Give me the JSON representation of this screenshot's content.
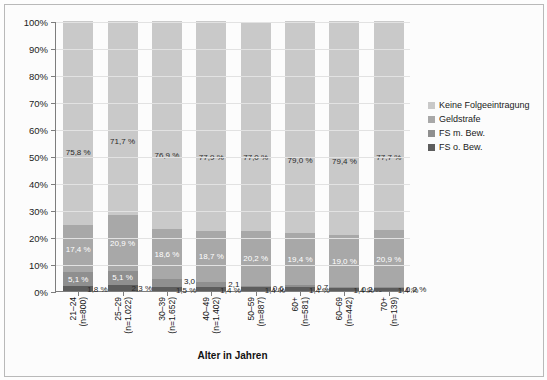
{
  "chart_data": {
    "type": "bar",
    "subtype": "stacked-100-percent",
    "title": "",
    "xlabel": "Alter in Jahren",
    "ylabel": "",
    "ylim": [
      0,
      100
    ],
    "ytick_labels": [
      "0%",
      "10%",
      "20%",
      "30%",
      "40%",
      "50%",
      "60%",
      "70%",
      "80%",
      "90%",
      "100%"
    ],
    "ytick_values": [
      0,
      10,
      20,
      30,
      40,
      50,
      60,
      70,
      80,
      90,
      100
    ],
    "grid": true,
    "legend_position": "right",
    "categories": [
      "21–24",
      "25–29",
      "30–39",
      "40–49",
      "50–59",
      "60+",
      "60–69",
      "70+"
    ],
    "category_sublabels": [
      "(n=800)",
      "(n=1.022)",
      "(n=1.652)",
      "(n=1.402)",
      "(n=887)",
      "(n=581)",
      "(n=442)",
      "(n=139)"
    ],
    "series": [
      {
        "name": "FS o. Bew.",
        "color": "#5d5d5d",
        "values": [
          1.8,
          2.3,
          1.5,
          1.4,
          1.4,
          1.4,
          1.4,
          1.4
        ],
        "labels": [
          "1,8 %",
          "2,3 %",
          "1,5 %",
          "1,4 %",
          "1,4 %",
          "1,4 %",
          "1,4 %",
          "1,4 %"
        ]
      },
      {
        "name": "FS m. Bew.",
        "color": "#8f8f8f",
        "values": [
          5.1,
          5.1,
          3.0,
          2.1,
          0.6,
          0.7,
          0.2,
          0.2
        ],
        "labels": [
          "5,1 %",
          "5,1 %",
          "3,0 %",
          "2,1 %",
          "0,6 %",
          "0,7 %",
          "0,2 %",
          "0,2 %"
        ]
      },
      {
        "name": "Geldstrafe",
        "color": "#a8a8a8",
        "values": [
          17.4,
          20.9,
          18.6,
          18.7,
          20.2,
          19.4,
          19.0,
          20.9
        ],
        "labels": [
          "17,4 %",
          "20,9 %",
          "18,6 %",
          "18,7 %",
          "20,2 %",
          "19,4 %",
          "19,0 %",
          "20,9 %"
        ]
      },
      {
        "name": "Keine Folgeeintragung",
        "color": "#c9c9c9",
        "values": [
          75.8,
          71.7,
          76.9,
          77.9,
          77.0,
          79.0,
          79.4,
          77.7
        ],
        "labels": [
          "75,8 %",
          "71,7 %",
          "76,9 %",
          "77,9 %",
          "77,0 %",
          "79,0 %",
          "79,4 %",
          "77,7 %"
        ]
      }
    ]
  },
  "legend": {
    "items": [
      {
        "label": "Keine Folgeeintragung",
        "color": "#c9c9c9"
      },
      {
        "label": "Geldstrafe",
        "color": "#a8a8a8"
      },
      {
        "label": "FS m. Bew.",
        "color": "#8f8f8f"
      },
      {
        "label": "FS o. Bew.",
        "color": "#5d5d5d"
      }
    ]
  },
  "axis": {
    "x_title": "Alter in Jahren"
  },
  "colors": {
    "plot_background": "#fcfcfc",
    "grid": "#e2e2e2",
    "axis": "#7d7d7d",
    "text": "#1a1a1a"
  }
}
